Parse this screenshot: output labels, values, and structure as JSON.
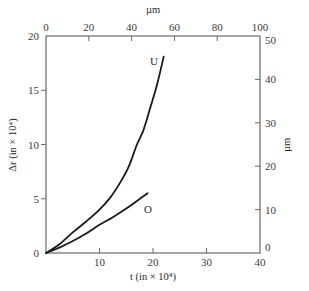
{
  "chart_data": {
    "type": "line",
    "title": "",
    "xlabel": "t (in × 10⁴)",
    "ylabel": "Δr (in × 10⁴)",
    "x2label": "µm",
    "y2label": "µm",
    "xlim": [
      0,
      40
    ],
    "ylim": [
      0,
      20
    ],
    "x2lim": [
      0,
      100
    ],
    "y2lim": [
      0,
      50
    ],
    "xticks": [
      0,
      10,
      20,
      30,
      40
    ],
    "yticks": [
      0,
      5,
      10,
      15,
      20
    ],
    "x2ticks": [
      0,
      20,
      40,
      60,
      80,
      100
    ],
    "y2ticks": [
      0,
      10,
      20,
      30,
      40,
      50
    ],
    "grid": false,
    "legend": "none (curves labeled directly)",
    "series": [
      {
        "name": "U",
        "x": [
          0,
          2.5,
          5,
          7.5,
          10,
          12,
          14,
          15.5,
          17,
          18.2,
          19.5,
          20.8,
          22
        ],
        "y": [
          0,
          0.8,
          1.9,
          2.9,
          4.0,
          5.1,
          6.6,
          8.0,
          10.0,
          11.3,
          13.4,
          15.6,
          18.1
        ]
      },
      {
        "name": "O",
        "x": [
          0,
          2.5,
          5,
          7.5,
          10,
          12.5,
          15,
          17,
          19
        ],
        "y": [
          0,
          0.5,
          1.1,
          1.8,
          2.6,
          3.3,
          4.1,
          4.8,
          5.5
        ]
      }
    ],
    "annotations": [
      "U",
      "O"
    ]
  }
}
